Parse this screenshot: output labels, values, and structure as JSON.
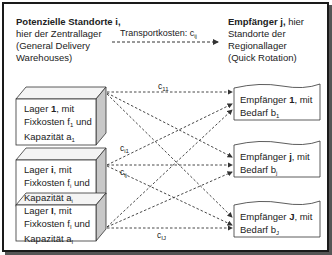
{
  "header_left": {
    "title": "Potenzielle Standorte i,",
    "lines": [
      "hier der Zentrallager",
      "(General Delivery",
      "Warehouses)"
    ]
  },
  "header_right": {
    "title": "Empfänger j,",
    "title_suffix": " hier",
    "lines": [
      "Standorte der",
      "Regionallager",
      "(Quick Rotation)"
    ]
  },
  "legend": {
    "label": "Transportkosten: c",
    "sub": "ij"
  },
  "sources": [
    {
      "l1a": "Lager ",
      "l1b": "1",
      "l1c": ", mit",
      "l2": "Fixkosten f",
      "l2sub": "1",
      "l2end": " und",
      "l3": "Kapazität a",
      "l3sub": "1"
    },
    {
      "l1a": "Lager ",
      "l1b": "i",
      "l1c": ", mit",
      "l2": "Fixkosten f",
      "l2sub": "i",
      "l2end": " und",
      "l3": "Kapazität a",
      "l3sub": "i"
    },
    {
      "l1a": "Lager ",
      "l1b": "I",
      "l1c": ", mit",
      "l2": "Fixkosten f",
      "l2sub": "I",
      "l2end": " und",
      "l3": "Kapazität a",
      "l3sub": "I"
    }
  ],
  "sinks": [
    {
      "l1a": "Empfänger ",
      "l1b": "1",
      "l1c": ", mit",
      "l2": "Bedarf b",
      "l2sub": "1"
    },
    {
      "l1a": "Empfänger ",
      "l1b": "j",
      "l1c": ", mit",
      "l2": "Bedarf b",
      "l2sub": "j"
    },
    {
      "l1a": "Empfänger ",
      "l1b": "J",
      "l1c": ", mit",
      "l2": "Bedarf b",
      "l2sub": "J"
    }
  ],
  "edge_labels": [
    {
      "base": "c",
      "sub": "11"
    },
    {
      "base": "c",
      "sub": "i1"
    },
    {
      "base": "c",
      "sub": "ij"
    },
    {
      "base": "c",
      "sub": "IJ"
    }
  ]
}
